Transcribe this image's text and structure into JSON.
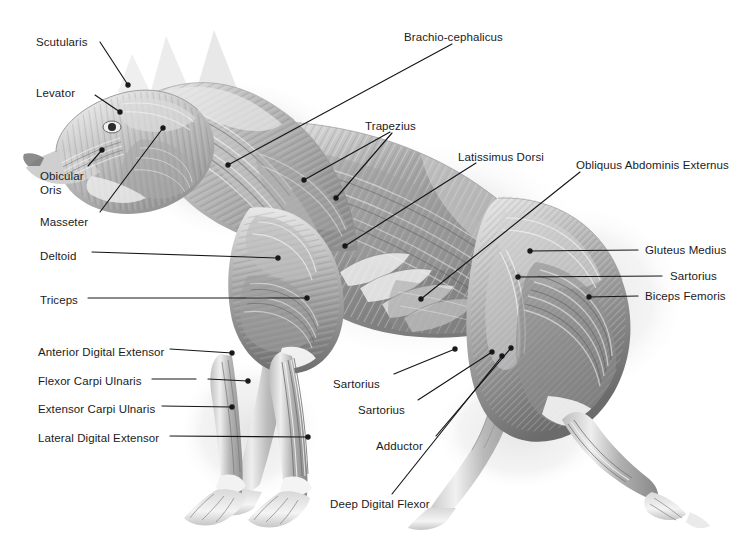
{
  "figure": {
    "background_color": "#ffffff",
    "label_color": "#1b1b1b",
    "leader_color": "#14161a",
    "art_tone_light": "#f2f2f2",
    "art_tone_mid": "#9a9a9a",
    "art_tone_dark": "#4a4a4a",
    "shadow_tone": "#d9d9d9"
  },
  "labels": [
    {
      "id": "scutularis",
      "text": "Scutularis",
      "x": 36,
      "y": 36,
      "align": "left"
    },
    {
      "id": "levator",
      "text": "Levator",
      "x": 36,
      "y": 87,
      "align": "left"
    },
    {
      "id": "obicular-oris",
      "text": "Obicular\nOris",
      "x": 40,
      "y": 170,
      "align": "left"
    },
    {
      "id": "masseter",
      "text": "Masseter",
      "x": 40,
      "y": 216,
      "align": "left"
    },
    {
      "id": "deltoid",
      "text": "Deltoid",
      "x": 40,
      "y": 250,
      "align": "left"
    },
    {
      "id": "triceps",
      "text": "Triceps",
      "x": 40,
      "y": 294,
      "align": "left"
    },
    {
      "id": "anterior-digital-extensor",
      "text": "Anterior Digital Extensor",
      "x": 38,
      "y": 346,
      "align": "left"
    },
    {
      "id": "flexor-carpi-ulnaris",
      "text": "Flexor Carpi Ulnaris",
      "x": 38,
      "y": 375,
      "align": "left"
    },
    {
      "id": "extensor-carpi-ulnaris",
      "text": "Extensor Carpi Ulnaris",
      "x": 38,
      "y": 403,
      "align": "left"
    },
    {
      "id": "lateral-digital-extensor",
      "text": "Lateral Digital Extensor",
      "x": 38,
      "y": 432,
      "align": "left"
    },
    {
      "id": "brachio-cephalicus",
      "text": "Brachio-cephalicus",
      "x": 404,
      "y": 31,
      "align": "left"
    },
    {
      "id": "trapezius",
      "text": "Trapezius",
      "x": 365,
      "y": 120,
      "align": "left"
    },
    {
      "id": "latissimus-dorsi",
      "text": "Latissimus Dorsi",
      "x": 458,
      "y": 151,
      "align": "left"
    },
    {
      "id": "obliquus-abdominis-externus",
      "text": "Obliquus Abdominis Externus",
      "x": 576,
      "y": 159,
      "align": "left"
    },
    {
      "id": "gluteus-medius",
      "text": "Gluteus Medius",
      "x": 645,
      "y": 244,
      "align": "left"
    },
    {
      "id": "sartorius-right",
      "text": "Sartorius",
      "x": 670,
      "y": 270,
      "align": "left"
    },
    {
      "id": "biceps-femoris",
      "text": "Biceps Femoris",
      "x": 645,
      "y": 290,
      "align": "left"
    },
    {
      "id": "sartorius-lower-1",
      "text": "Sartorius",
      "x": 333,
      "y": 378,
      "align": "left"
    },
    {
      "id": "sartorius-lower-2",
      "text": "Sartorius",
      "x": 358,
      "y": 404,
      "align": "left"
    },
    {
      "id": "adductor",
      "text": "Adductor",
      "x": 376,
      "y": 440,
      "align": "left"
    },
    {
      "id": "deep-digital-flexor",
      "text": "Deep Digital Flexor",
      "x": 330,
      "y": 498,
      "align": "left"
    }
  ],
  "leaders": [
    {
      "id": "leader-scutularis",
      "from": [
        100,
        42
      ],
      "to": [
        128,
        85
      ],
      "dot": "end"
    },
    {
      "id": "leader-levator",
      "from": [
        95,
        95
      ],
      "to": [
        120,
        112
      ],
      "dot": "end"
    },
    {
      "id": "leader-obicular-oris",
      "from": [
        88,
        166
      ],
      "to": [
        102,
        150
      ],
      "dot": "end"
    },
    {
      "id": "leader-masseter",
      "from": [
        100,
        212
      ],
      "to": [
        163,
        128
      ],
      "dot": "end"
    },
    {
      "id": "leader-deltoid",
      "from": [
        92,
        252
      ],
      "to": [
        278,
        258
      ],
      "dot": "end"
    },
    {
      "id": "leader-triceps",
      "from": [
        88,
        298
      ],
      "to": [
        307,
        298
      ],
      "dot": "end"
    },
    {
      "id": "leader-anterior-digital-extensor",
      "from": [
        170,
        349
      ],
      "to": [
        232,
        353
      ],
      "dot": "end"
    },
    {
      "id": "leader-flexor-carpi-ulnaris-a",
      "from": [
        152,
        379
      ],
      "to": [
        196,
        379
      ],
      "dot": "none"
    },
    {
      "id": "leader-flexor-carpi-ulnaris-b",
      "from": [
        208,
        379
      ],
      "to": [
        248,
        381
      ],
      "dot": "end"
    },
    {
      "id": "leader-extensor-carpi-ulnaris",
      "from": [
        162,
        406
      ],
      "to": [
        232,
        407
      ],
      "dot": "end"
    },
    {
      "id": "leader-lateral-digital-extensor",
      "from": [
        170,
        436
      ],
      "to": [
        308,
        437
      ],
      "dot": "end"
    },
    {
      "id": "leader-brachio-cephalicus",
      "from": [
        452,
        44
      ],
      "to": [
        228,
        165
      ],
      "dot": "end"
    },
    {
      "id": "leader-trapezius-a",
      "from": [
        390,
        132
      ],
      "to": [
        304,
        180
      ],
      "dot": "end"
    },
    {
      "id": "leader-trapezius-b",
      "from": [
        392,
        133
      ],
      "to": [
        336,
        198
      ],
      "dot": "end"
    },
    {
      "id": "leader-latissimus-dorsi",
      "from": [
        476,
        163
      ],
      "to": [
        345,
        246
      ],
      "dot": "end"
    },
    {
      "id": "leader-obliquus",
      "from": [
        580,
        172
      ],
      "to": [
        421,
        299
      ],
      "dot": "end"
    },
    {
      "id": "leader-gluteus-medius",
      "from": [
        638,
        250
      ],
      "to": [
        530,
        251
      ],
      "dot": "end"
    },
    {
      "id": "leader-sartorius-right",
      "from": [
        662,
        276
      ],
      "to": [
        518,
        277
      ],
      "dot": "end"
    },
    {
      "id": "leader-biceps-femoris",
      "from": [
        638,
        296
      ],
      "to": [
        589,
        297
      ],
      "dot": "end"
    },
    {
      "id": "leader-sartorius-lower-1",
      "from": [
        394,
        374
      ],
      "to": [
        455,
        349
      ],
      "dot": "end"
    },
    {
      "id": "leader-sartorius-lower-2",
      "from": [
        418,
        400
      ],
      "to": [
        492,
        352
      ],
      "dot": "end"
    },
    {
      "id": "leader-adductor",
      "from": [
        436,
        436
      ],
      "to": [
        511,
        348
      ],
      "dot": "end"
    },
    {
      "id": "leader-deep-digital-flexor",
      "from": [
        392,
        494
      ],
      "to": [
        502,
        356
      ],
      "dot": "end"
    }
  ]
}
